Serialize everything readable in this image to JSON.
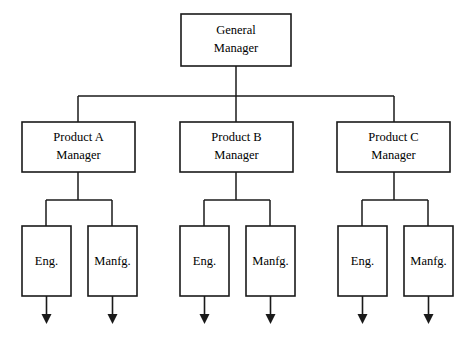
{
  "diagram": {
    "type": "organization-chart",
    "background_color": "#ffffff",
    "line_color": "#1a1a1a",
    "text_color": "#000000",
    "root": {
      "id": "general-manager",
      "line1": "General",
      "line2": "Manager"
    },
    "divisions": [
      {
        "id": "product-a-manager",
        "line1": "Product A",
        "line2": "Manager",
        "children": [
          {
            "id": "product-a-eng",
            "label": "Eng."
          },
          {
            "id": "product-a-manfg",
            "label": "Manfg."
          }
        ]
      },
      {
        "id": "product-b-manager",
        "line1": "Product B",
        "line2": "Manager",
        "children": [
          {
            "id": "product-b-eng",
            "label": "Eng."
          },
          {
            "id": "product-b-manfg",
            "label": "Manfg."
          }
        ]
      },
      {
        "id": "product-c-manager",
        "line1": "Product C",
        "line2": "Manager",
        "children": [
          {
            "id": "product-c-eng",
            "label": "Eng."
          },
          {
            "id": "product-c-manfg",
            "label": "Manfg."
          }
        ]
      }
    ]
  }
}
